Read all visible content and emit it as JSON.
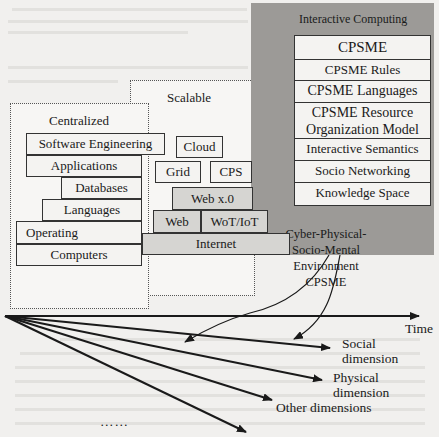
{
  "figure": {
    "regions": {
      "centralized": {
        "label": "Centralized",
        "layers": [
          "Software Engineering",
          "Applications",
          "Databases",
          "Languages",
          "Operating",
          "Computers"
        ]
      },
      "scalable": {
        "label": "Scalable",
        "layers": [
          "Cloud",
          "Grid",
          "CPS",
          "Web x.0",
          "Web",
          "WoT/IoT",
          "Internet"
        ]
      },
      "interactive": {
        "label": "Interactive Computing",
        "layers": [
          "CPSME",
          "CPSME Rules",
          "CPSME Languages",
          "CPSME Resource",
          "Organization Model",
          "Interactive Semantics",
          "Socio Networking",
          "Knowledge Space"
        ],
        "environment_lines": [
          "Cyber-Physical-",
          "Socio-Mental",
          "Environment",
          "CPSME"
        ]
      }
    },
    "axes": {
      "time": "Time",
      "social": [
        "Social",
        "dimension"
      ],
      "physical": [
        "Physical",
        "dimension"
      ],
      "other": "Other dimensions",
      "ellipsis": "……"
    },
    "colors": {
      "interactive_panel": "#9c9a97",
      "box_fill": "#f4f3f1",
      "gray_box": "#d6d5d2",
      "line": "#1a1a1a"
    }
  }
}
